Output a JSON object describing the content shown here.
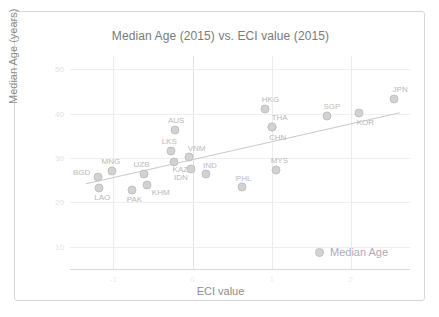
{
  "chart_data": {
    "type": "scatter",
    "title": "Median Age (2015) vs. ECI value (2015)",
    "xlabel": "ECI value",
    "ylabel": "Median Age (years)",
    "xlim": [
      -1.55,
      2.75
    ],
    "ylim": [
      5,
      53
    ],
    "xticks": [
      "-1",
      "0",
      "1",
      "2"
    ],
    "xtick_values": [
      -1,
      0,
      1,
      2
    ],
    "yticks": [
      "50",
      "40",
      "30",
      "20",
      "10"
    ],
    "ytick_values": [
      50,
      40,
      30,
      20,
      10
    ],
    "grid": true,
    "legend": {
      "position": "bottom-right",
      "entries": [
        "Median Age"
      ]
    },
    "series_name": "Median Age",
    "marker_color": "#d2d2d2",
    "trendline_color": "#c9c9c9",
    "trendline": {
      "x0": -1.35,
      "y0": 24.2,
      "x1": 2.62,
      "y1": 40.2
    },
    "points": [
      {
        "label": "BGD",
        "x": -1.2,
        "y": 25.8,
        "label_dx": -16,
        "label_dy": -5
      },
      {
        "label": "LAO",
        "x": -1.18,
        "y": 23.2,
        "label_dx": 3,
        "label_dy": 9
      },
      {
        "label": "MNG",
        "x": -1.02,
        "y": 27.0,
        "label_dx": -1,
        "label_dy": -10
      },
      {
        "label": "PAK",
        "x": -0.76,
        "y": 22.9,
        "label_dx": 2,
        "label_dy": 9
      },
      {
        "label": "KHM",
        "x": -0.58,
        "y": 24.0,
        "label_dx": 14,
        "label_dy": 7
      },
      {
        "label": "UZB",
        "x": -0.62,
        "y": 26.3,
        "label_dx": -2,
        "label_dy": -10
      },
      {
        "label": "AUS",
        "x": -0.22,
        "y": 36.4,
        "label_dx": 1,
        "label_dy": -10
      },
      {
        "label": "LKS",
        "x": -0.27,
        "y": 31.6,
        "label_dx": -2,
        "label_dy": -10
      },
      {
        "label": "KAZ",
        "x": -0.23,
        "y": 29.2,
        "label_dx": 6,
        "label_dy": 7
      },
      {
        "label": "VNM",
        "x": -0.05,
        "y": 30.2,
        "label_dx": 8,
        "label_dy": -9
      },
      {
        "label": "IDN",
        "x": -0.02,
        "y": 27.6,
        "label_dx": -10,
        "label_dy": 8
      },
      {
        "label": "IND",
        "x": 0.17,
        "y": 26.4,
        "label_dx": 4,
        "label_dy": -9
      },
      {
        "label": "PHL",
        "x": 0.62,
        "y": 23.5,
        "label_dx": 2,
        "label_dy": -9
      },
      {
        "label": "MYS",
        "x": 1.06,
        "y": 27.3,
        "label_dx": 3,
        "label_dy": -10
      },
      {
        "label": "HKG",
        "x": 0.91,
        "y": 41.0,
        "label_dx": 6,
        "label_dy": -10
      },
      {
        "label": "THA",
        "x": 1.0,
        "y": 36.9,
        "label_dx": 8,
        "label_dy": -10
      },
      {
        "label": "CHN",
        "x": 1.0,
        "y": 36.9,
        "label_dx": 6,
        "label_dy": 10
      },
      {
        "label": "SGP",
        "x": 1.7,
        "y": 39.4,
        "label_dx": 5,
        "label_dy": -10
      },
      {
        "label": "KOR",
        "x": 2.11,
        "y": 40.1,
        "label_dx": 6,
        "label_dy": 9
      },
      {
        "label": "JPN",
        "x": 2.55,
        "y": 43.4,
        "label_dx": 6,
        "label_dy": -10
      }
    ]
  }
}
